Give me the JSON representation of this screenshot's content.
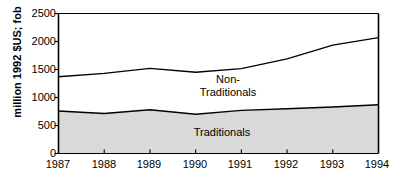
{
  "chart_data": {
    "type": "area",
    "title": "",
    "subtitle": "",
    "xlabel": "",
    "ylabel": "million 1992 $US; fob",
    "categories": [
      "1987",
      "1988",
      "1989",
      "1990",
      "1991",
      "1992",
      "1993",
      "1994"
    ],
    "x": [
      1987,
      1988,
      1989,
      1990,
      1991,
      1992,
      1993,
      1994
    ],
    "xlim": [
      1987,
      1994
    ],
    "ylim": [
      0,
      2500
    ],
    "yticks": [
      0,
      500,
      1000,
      1500,
      2000,
      2500
    ],
    "ytick_labels": [
      "0",
      "500",
      "1000",
      "1500",
      "2000",
      "2500"
    ],
    "grid": false,
    "legend_position": "inline-annotations",
    "stacked": true,
    "series": [
      {
        "name": "Traditionals",
        "values": [
          760,
          715,
          780,
          700,
          770,
          800,
          830,
          870
        ],
        "fill": "#d9d9d9",
        "stroke": "#000000"
      },
      {
        "name": "Non-Traditionals",
        "values": [
          610,
          715,
          740,
          750,
          745,
          890,
          1105,
          1200
        ],
        "fill": "#ffffff",
        "stroke": "#000000"
      }
    ],
    "cumulative_totals": [
      1370,
      1430,
      1520,
      1450,
      1515,
      1690,
      1935,
      2070
    ],
    "annotations": [
      {
        "text": "Non-\nTraditionals",
        "x": 1990.35,
        "y": 1075
      },
      {
        "text": "Traditionals",
        "x": 1990.2,
        "y": 370
      }
    ]
  },
  "axes": {
    "ylabel": "million 1992 $US; fob",
    "ytick_labels": [
      "2500",
      "2000",
      "1500",
      "1000",
      "500",
      "0"
    ],
    "xtick_labels": [
      "1987",
      "1988",
      "1989",
      "1990",
      "1991",
      "1992",
      "1993",
      "1994"
    ]
  },
  "labels": {
    "non_traditionals": "Non-\nTraditionals",
    "traditionals": "Traditionals"
  },
  "colors": {
    "traditionals_fill": "#d9d9d9",
    "non_traditionals_fill": "#ffffff",
    "line": "#000000",
    "axis": "#000000",
    "background": "#ffffff"
  }
}
